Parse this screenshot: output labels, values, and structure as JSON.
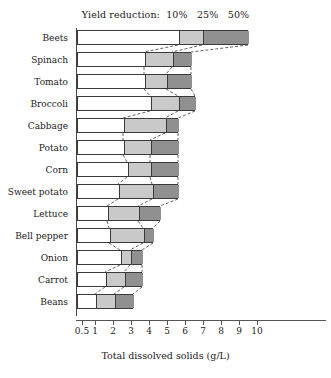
{
  "chart_data": {
    "type": "bar",
    "title": "",
    "legend_prefix": "Yield reduction:",
    "legend_entries": [
      {
        "label": "10%",
        "color": "#ffffff"
      },
      {
        "label": "25%",
        "color": "#c9c9c9"
      },
      {
        "label": "50%",
        "color": "#909090"
      }
    ],
    "legend_position": "top-center",
    "xlabel": "Total dissolved solids (g/L)",
    "ylabel": "",
    "grid": false,
    "xticks": [
      {
        "label": "0.5",
        "value": 0.5,
        "px": 82
      },
      {
        "label": "1",
        "value": 1,
        "px": 95
      },
      {
        "label": "2",
        "value": 2,
        "px": 113
      },
      {
        "label": "3",
        "value": 3,
        "px": 131
      },
      {
        "label": "4",
        "value": 4,
        "px": 149
      },
      {
        "label": "5",
        "value": 5,
        "px": 167
      },
      {
        "label": "6",
        "value": 6,
        "px": 185
      },
      {
        "label": "7",
        "value": 7,
        "px": 203
      },
      {
        "label": "8",
        "value": 8,
        "px": 221
      },
      {
        "label": "9",
        "value": 9,
        "px": 239
      },
      {
        "label": "10",
        "value": 10,
        "px": 257
      }
    ],
    "xlim": [
      0,
      10
    ],
    "categories": [
      "Beets",
      "Spinach",
      "Tomato",
      "Broccoli",
      "Cabbage",
      "Potato",
      "Corn",
      "Sweet potato",
      "Lettuce",
      "Bell pepper",
      "Onion",
      "Carrot",
      "Beans"
    ],
    "series": [
      {
        "name": "10%",
        "values": [
          5.6,
          4.1,
          4.1,
          4.1,
          2.6,
          2.6,
          2.9,
          2.3,
          1.7,
          1.8,
          2.4,
          1.6,
          1.1
        ]
      },
      {
        "name": "25%",
        "values": [
          6.9,
          5.7,
          5.2,
          5.6,
          5.0,
          4.0,
          4.0,
          4.2,
          3.4,
          3.7,
          2.9,
          2.7,
          2.0
        ]
      },
      {
        "name": "50%",
        "values": [
          9.5,
          6.8,
          6.8,
          6.6,
          5.7,
          5.6,
          5.6,
          5.6,
          4.6,
          4.2,
          3.6,
          3.6,
          3.1
        ]
      }
    ],
    "rows_px": [
      {
        "category": "Beets",
        "y": 30,
        "h": 15,
        "x0": 77,
        "x1": 178,
        "x2": 202,
        "x3": 248
      },
      {
        "category": "Spinach",
        "y": 52,
        "h": 15,
        "x0": 77,
        "x1": 144,
        "x2": 172,
        "x3": 191
      },
      {
        "category": "Tomato",
        "y": 74,
        "h": 15,
        "x0": 77,
        "x1": 144,
        "x2": 166,
        "x3": 191
      },
      {
        "category": "Broccoli",
        "y": 96,
        "h": 15,
        "x0": 77,
        "x1": 150,
        "x2": 178,
        "x3": 195
      },
      {
        "category": "Cabbage",
        "y": 118,
        "h": 15,
        "x0": 77,
        "x1": 123,
        "x2": 165,
        "x3": 178
      },
      {
        "category": "Potato",
        "y": 140,
        "h": 15,
        "x0": 77,
        "x1": 123,
        "x2": 150,
        "x3": 178
      },
      {
        "category": "Corn",
        "y": 162,
        "h": 15,
        "x0": 77,
        "x1": 127,
        "x2": 150,
        "x3": 178
      },
      {
        "category": "Sweet potato",
        "y": 184,
        "h": 15,
        "x0": 77,
        "x1": 118,
        "x2": 152,
        "x3": 178
      },
      {
        "category": "Lettuce",
        "y": 206,
        "h": 15,
        "x0": 77,
        "x1": 107,
        "x2": 138,
        "x3": 160
      },
      {
        "category": "Bell pepper",
        "y": 228,
        "h": 15,
        "x0": 77,
        "x1": 109,
        "x2": 143,
        "x3": 153
      },
      {
        "category": "Onion",
        "y": 250,
        "h": 15,
        "x0": 77,
        "x1": 120,
        "x2": 130,
        "x3": 142
      },
      {
        "category": "Carrot",
        "y": 272,
        "h": 15,
        "x0": 77,
        "x1": 105,
        "x2": 124,
        "x3": 142
      },
      {
        "category": "Beans",
        "y": 294,
        "h": 15,
        "x0": 77,
        "x1": 95,
        "x2": 114,
        "x3": 133
      }
    ]
  },
  "axis": {
    "x_title": "Total dissolved solids (g/L)"
  }
}
